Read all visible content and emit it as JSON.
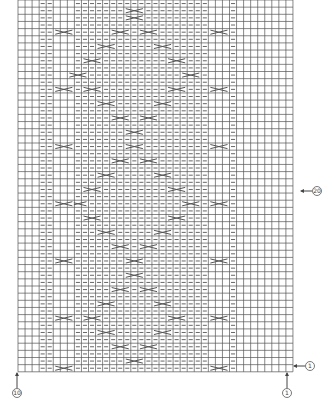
{
  "diagram": {
    "type": "knitting-chart",
    "grid": {
      "columns": 39,
      "rows": 52,
      "origin_x": 18,
      "origin_y": 0,
      "cell_w": 7.05,
      "cell_h": 7.15,
      "line_color": "#555555",
      "bg_color": "#ffffff"
    },
    "symbols": {
      "purl": {
        "glyph": "dash",
        "color": "#666666"
      },
      "cable": {
        "glyph": "cross",
        "color": "#555555",
        "span": 3
      }
    },
    "purl_columns": [
      3,
      4,
      8,
      9,
      10,
      11,
      12,
      13,
      14,
      15,
      16,
      17,
      18,
      19,
      20,
      21,
      22,
      23,
      24,
      25,
      26,
      30
    ],
    "stockinette_panels": [
      {
        "from": 5,
        "to": 7
      },
      {
        "from": 27,
        "to": 29
      }
    ],
    "side_cables": {
      "columns": [
        5,
        27
      ],
      "rows": [
        4,
        12,
        20,
        28,
        36,
        44,
        51
      ]
    },
    "diamond_cables": [
      {
        "row": 1,
        "col": 15
      },
      {
        "row": 2,
        "col": 15
      },
      {
        "row": 4,
        "col": 13
      },
      {
        "row": 4,
        "col": 17
      },
      {
        "row": 6,
        "col": 11
      },
      {
        "row": 6,
        "col": 19
      },
      {
        "row": 8,
        "col": 9
      },
      {
        "row": 8,
        "col": 21
      },
      {
        "row": 10,
        "col": 7
      },
      {
        "row": 10,
        "col": 23
      },
      {
        "row": 12,
        "col": 9
      },
      {
        "row": 12,
        "col": 21
      },
      {
        "row": 14,
        "col": 11
      },
      {
        "row": 14,
        "col": 19
      },
      {
        "row": 16,
        "col": 13
      },
      {
        "row": 16,
        "col": 17
      },
      {
        "row": 18,
        "col": 15
      },
      {
        "row": 20,
        "col": 15
      },
      {
        "row": 22,
        "col": 13
      },
      {
        "row": 22,
        "col": 17
      },
      {
        "row": 24,
        "col": 11
      },
      {
        "row": 24,
        "col": 19
      },
      {
        "row": 26,
        "col": 9
      },
      {
        "row": 26,
        "col": 21
      },
      {
        "row": 28,
        "col": 7
      },
      {
        "row": 28,
        "col": 23
      },
      {
        "row": 30,
        "col": 9
      },
      {
        "row": 30,
        "col": 21
      },
      {
        "row": 32,
        "col": 11
      },
      {
        "row": 32,
        "col": 19
      },
      {
        "row": 34,
        "col": 13
      },
      {
        "row": 34,
        "col": 17
      },
      {
        "row": 36,
        "col": 15
      },
      {
        "row": 38,
        "col": 15
      },
      {
        "row": 40,
        "col": 13
      },
      {
        "row": 40,
        "col": 17
      },
      {
        "row": 42,
        "col": 11
      },
      {
        "row": 42,
        "col": 19
      },
      {
        "row": 44,
        "col": 9
      },
      {
        "row": 44,
        "col": 21
      },
      {
        "row": 46,
        "col": 11
      },
      {
        "row": 46,
        "col": 19
      },
      {
        "row": 48,
        "col": 13
      },
      {
        "row": 48,
        "col": 17
      },
      {
        "row": 50,
        "col": 15
      }
    ],
    "markers": [
      {
        "id": "row-marker-right",
        "label": "①",
        "x": 298,
        "y": 366,
        "arrow": "left"
      },
      {
        "id": "col-marker-bottom-right",
        "label": "①",
        "x": 287,
        "y": 381,
        "arrow": "up"
      },
      {
        "id": "col-marker-bottom-left",
        "label": "⑩",
        "x": 17,
        "y": 381,
        "arrow": "up"
      },
      {
        "id": "row-marker-mid-right",
        "label": "⑳",
        "x": 305,
        "y": 191,
        "arrow": "left"
      }
    ]
  }
}
